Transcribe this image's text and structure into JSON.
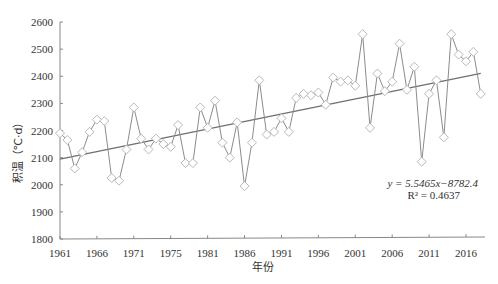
{
  "chart_data": {
    "type": "line",
    "title": "",
    "xlabel": "年份",
    "ylabel": "积温（℃·d）",
    "ylim": [
      1800,
      2600
    ],
    "xlim": [
      1961,
      2018
    ],
    "yticks": [
      1800,
      1900,
      2000,
      2100,
      2200,
      2300,
      2400,
      2500,
      2600
    ],
    "xticks": [
      1961,
      1966,
      1971,
      1975,
      1981,
      1986,
      1991,
      1996,
      2001,
      2006,
      2011,
      2016
    ],
    "xtick_positions": [
      1961,
      1966,
      1971,
      1976,
      1981,
      1986,
      1991,
      1996,
      2001,
      2006,
      2011,
      2016
    ],
    "grid": false,
    "legend": null,
    "x": [
      1961,
      1962,
      1963,
      1964,
      1965,
      1966,
      1967,
      1968,
      1969,
      1970,
      1971,
      1972,
      1973,
      1974,
      1975,
      1976,
      1977,
      1978,
      1979,
      1980,
      1981,
      1982,
      1983,
      1984,
      1985,
      1986,
      1987,
      1988,
      1989,
      1990,
      1991,
      1992,
      1993,
      1994,
      1995,
      1996,
      1997,
      1998,
      1999,
      2000,
      2001,
      2002,
      2003,
      2004,
      2005,
      2006,
      2007,
      2008,
      2009,
      2010,
      2011,
      2012,
      2013,
      2014,
      2015,
      2016,
      2017,
      2018
    ],
    "series": [
      {
        "name": "积温",
        "marker": "diamond-open",
        "values": [
          2190,
          2165,
          2060,
          2120,
          2195,
          2240,
          2235,
          2025,
          2015,
          2130,
          2285,
          2170,
          2130,
          2170,
          2150,
          2140,
          2220,
          2080,
          2080,
          2285,
          2210,
          2310,
          2155,
          2100,
          2230,
          1995,
          2155,
          2385,
          2185,
          2195,
          2245,
          2195,
          2320,
          2335,
          2330,
          2340,
          2295,
          2395,
          2380,
          2385,
          2365,
          2555,
          2210,
          2410,
          2345,
          2380,
          2520,
          2350,
          2435,
          2085,
          2335,
          2385,
          2175,
          2555,
          2480,
          2455,
          2490,
          2335
        ]
      },
      {
        "name": "linear trend",
        "type": "line",
        "slope": 5.5465,
        "intercept": -8782.4,
        "values_at_ends": {
          "1961": 2091.2,
          "2018": 2407.4
        }
      }
    ],
    "annotations": [
      {
        "text": "y = 5.5465x−8782.4",
        "x": 2011,
        "y": 1975
      },
      {
        "text": "R² = 0.4637",
        "x": 2011,
        "y": 1935
      }
    ]
  },
  "labels": {
    "ylabel": "积温（℃·d）",
    "xlabel": "年份",
    "equation": "y = 5.5465x−8782.4",
    "r2": "R² = 0.4637"
  },
  "colors": {
    "line": "#8c8c8c",
    "trend": "#6f6f6f",
    "marker_fill": "#ffffff",
    "marker_stroke": "#b0b0b0",
    "axis": "#888888"
  }
}
